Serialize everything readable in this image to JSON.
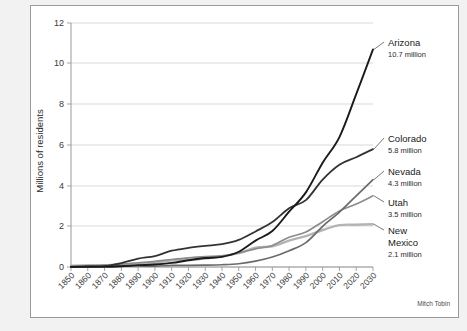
{
  "credit": "Mitch Tobin",
  "chart_data": {
    "type": "line",
    "title": "",
    "xlabel": "",
    "ylabel": "Millions of residents",
    "ylim": [
      0,
      12
    ],
    "yticks": [
      0,
      2,
      4,
      6,
      8,
      10,
      12
    ],
    "grid": true,
    "legend_position": "right-inline-labels",
    "x": [
      1850,
      1860,
      1870,
      1880,
      1890,
      1900,
      1910,
      1920,
      1930,
      1940,
      1950,
      1960,
      1970,
      1980,
      1990,
      2000,
      2010,
      2020,
      2030
    ],
    "categories": [
      "1850",
      "1860",
      "1870",
      "1880",
      "1890",
      "1900",
      "1910",
      "1920",
      "1930",
      "1940",
      "1950",
      "1960",
      "1970",
      "1980",
      "1990",
      "2000",
      "2010",
      "2020",
      "2030"
    ],
    "series": [
      {
        "name": "Arizona",
        "end_label": "10.7 million",
        "end_value": 10.7,
        "color": "#1a1a1a",
        "width": 1.9,
        "values": [
          0.01,
          0.01,
          0.01,
          0.04,
          0.09,
          0.12,
          0.2,
          0.33,
          0.44,
          0.5,
          0.75,
          1.3,
          1.77,
          2.72,
          3.67,
          5.13,
          6.39,
          8.5,
          10.7
        ]
      },
      {
        "name": "Colorado",
        "end_label": "5.8 million",
        "end_value": 5.8,
        "color": "#333333",
        "width": 1.8,
        "values": [
          0.0,
          0.03,
          0.04,
          0.19,
          0.41,
          0.54,
          0.8,
          0.94,
          1.04,
          1.12,
          1.33,
          1.75,
          2.21,
          2.89,
          3.29,
          4.3,
          5.03,
          5.4,
          5.8
        ]
      },
      {
        "name": "Nevada",
        "end_label": "4.3 million",
        "end_value": 4.3,
        "color": "#6a6a6a",
        "width": 1.7,
        "values": [
          0.0,
          0.01,
          0.04,
          0.06,
          0.05,
          0.04,
          0.08,
          0.08,
          0.09,
          0.11,
          0.16,
          0.29,
          0.49,
          0.8,
          1.2,
          2.0,
          2.7,
          3.5,
          4.3
        ]
      },
      {
        "name": "Utah",
        "end_label": "3.5 million",
        "end_value": 3.5,
        "color": "#8c8c8c",
        "width": 1.7,
        "values": [
          0.01,
          0.04,
          0.09,
          0.14,
          0.21,
          0.28,
          0.37,
          0.45,
          0.51,
          0.55,
          0.69,
          0.89,
          1.06,
          1.46,
          1.72,
          2.23,
          2.76,
          3.1,
          3.5
        ]
      },
      {
        "name": "New\nMexico",
        "end_label": "2.1 million",
        "end_value": 2.1,
        "color": "#b4b4b4",
        "width": 2.4,
        "values": [
          0.06,
          0.09,
          0.09,
          0.12,
          0.16,
          0.2,
          0.33,
          0.36,
          0.42,
          0.53,
          0.68,
          0.95,
          1.02,
          1.3,
          1.52,
          1.82,
          2.06,
          2.08,
          2.1
        ]
      }
    ],
    "labels": [
      {
        "name": "Arizona",
        "value_text": "10.7 million",
        "y": 40
      },
      {
        "name": "Colorado",
        "value_text": "5.8 million",
        "y": 136
      },
      {
        "name": "Nevada",
        "value_text": "4.3 million",
        "y": 169
      },
      {
        "name": "Utah",
        "value_text": "3.5 million",
        "y": 200
      },
      {
        "name": "New",
        "name2": "Mexico",
        "value_text": "2.1 million",
        "y": 228
      }
    ]
  }
}
